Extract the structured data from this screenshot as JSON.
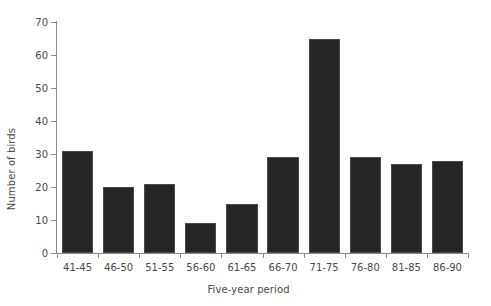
{
  "chart_data": {
    "type": "bar",
    "title": "",
    "xlabel": "Five-year period",
    "ylabel": "Number of birds",
    "categories": [
      "41-45",
      "46-50",
      "51-55",
      "56-60",
      "61-65",
      "66-70",
      "71-75",
      "76-80",
      "81-85",
      "86-90"
    ],
    "values": [
      31,
      20,
      21,
      9,
      15,
      29,
      65,
      29,
      27,
      28
    ],
    "ylim": [
      0,
      70
    ],
    "yticks": [
      0,
      10,
      20,
      30,
      40,
      50,
      60,
      70
    ],
    "ytick_labels": [
      "0",
      "10",
      "20",
      "30",
      "40",
      "50",
      "60",
      "70"
    ],
    "grid": false,
    "legend": false,
    "legend_position": "none",
    "bar_color": "#262626",
    "bar_edge_color": "#4b4b4b",
    "axis_color": "#8a8a8a",
    "text_color": "#4a4a4a",
    "background_color": "#ffffff"
  }
}
